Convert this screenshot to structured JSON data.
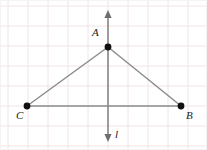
{
  "figure": {
    "width": 207,
    "height": 150,
    "background_color": "#ffffff",
    "grid": {
      "visible": true,
      "spacing": 20,
      "color": "#f0e4e6",
      "origin_x": 8,
      "origin_y": 6
    },
    "colors": {
      "grid": "#f0e4e6",
      "segment": "#8c8c8c",
      "axis_line": "#6e6e6e",
      "point": "#111111",
      "label": "#1a1a1a",
      "border": "#f4f4f4"
    },
    "labels": {
      "A": "A",
      "B": "B",
      "C": "C",
      "line": "l"
    },
    "points": [
      {
        "name": "A",
        "label": "A",
        "x": 108,
        "y": 47,
        "radius": 3.4
      },
      {
        "name": "C",
        "label": "C",
        "x": 27,
        "y": 106,
        "radius": 3.4
      },
      {
        "name": "B",
        "label": "B",
        "x": 181,
        "y": 106,
        "radius": 3.4
      }
    ],
    "segments": [
      {
        "name": "segment-CA",
        "from": "C",
        "to": "A",
        "x1": 27,
        "y1": 106,
        "x2": 108,
        "y2": 47
      },
      {
        "name": "segment-AB",
        "from": "A",
        "to": "B",
        "x1": 108,
        "y1": 47,
        "x2": 181,
        "y2": 106
      },
      {
        "name": "segment-CB",
        "from": "C",
        "to": "B",
        "x1": 27,
        "y1": 106,
        "x2": 181,
        "y2": 106
      }
    ],
    "vertical_line": {
      "name": "line-l",
      "label": "l",
      "x": 108,
      "y_top": 12,
      "y_bottom": 140,
      "arrow_top": true,
      "arrow_bottom": true
    }
  }
}
